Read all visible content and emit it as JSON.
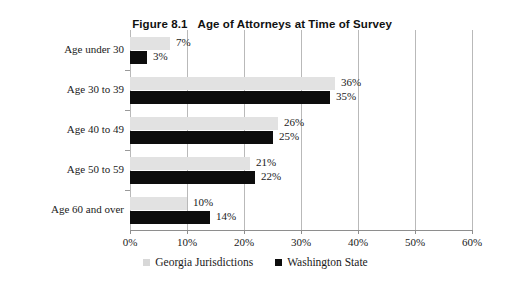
{
  "chart_data": {
    "type": "bar",
    "orientation": "horizontal",
    "title_number": "Figure 8.1",
    "title_text": "Age of Attorneys at Time of Survey",
    "xlabel": "",
    "ylabel": "",
    "xlim": [
      0,
      60
    ],
    "xticks": [
      0,
      10,
      20,
      30,
      40,
      50,
      60
    ],
    "xtick_labels": [
      "0%",
      "10%",
      "20%",
      "30%",
      "40%",
      "50%",
      "60%"
    ],
    "grid": "vertical",
    "legend_position": "bottom-center",
    "categories": [
      "Age under 30",
      "Age 30 to 39",
      "Age 40 to 49",
      "Age 50 to 59",
      "Age 60 and over"
    ],
    "series": [
      {
        "name": "Georgia Jurisdictions",
        "color": "#e2e2e2",
        "values": [
          7,
          36,
          26,
          21,
          10
        ],
        "labels": [
          "7%",
          "36%",
          "26%",
          "21%",
          "10%"
        ]
      },
      {
        "name": "Washington State",
        "color": "#0d0d0d",
        "values": [
          3,
          35,
          25,
          22,
          14
        ],
        "labels": [
          "3%",
          "35%",
          "25%",
          "22%",
          "14%"
        ]
      }
    ]
  },
  "legend": {
    "items": [
      {
        "label": "Georgia Jurisdictions",
        "swatch": "ga"
      },
      {
        "label": "Washington State",
        "swatch": "wa"
      }
    ]
  }
}
